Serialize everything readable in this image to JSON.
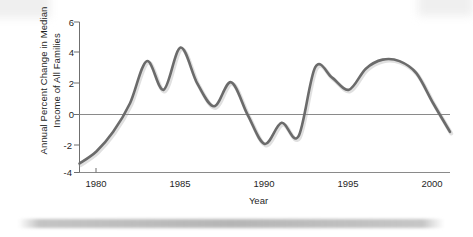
{
  "chart_data": {
    "type": "line",
    "title": "",
    "xlabel": "Year",
    "ylabel": "Annual Percent Change in Median\nIncome of All Families",
    "ylabel_line1": "Annual Percent Change in Median",
    "ylabel_line2": "Income of All Families",
    "xlim": [
      1979,
      2001
    ],
    "ylim": [
      -4,
      6
    ],
    "yticks": [
      6,
      4,
      2,
      0,
      -2,
      -4
    ],
    "ytick_labels": [
      "6",
      "4",
      "2",
      "0",
      "-2",
      "-4"
    ],
    "xticks": [
      1980,
      1985,
      1990,
      1995,
      2000
    ],
    "xtick_labels": [
      "1980",
      "1985",
      "1990",
      "1995",
      "2000"
    ],
    "grid": false,
    "legend": "none",
    "zero_line": 0,
    "line_color": "#6b6b6b",
    "axis_color": "#7a7a7a",
    "series": [
      {
        "name": "Annual percent change in median income of all families",
        "x": [
          1979,
          1980,
          1981,
          1982,
          1983,
          1984,
          1985,
          1986,
          1987,
          1988,
          1989,
          1990,
          1991,
          1992,
          1993,
          1994,
          1995,
          1996,
          1997,
          1998,
          1999,
          2000,
          2001
        ],
        "values": [
          -3.4,
          -2.6,
          -1.3,
          0.6,
          3.4,
          1.5,
          4.3,
          1.9,
          0.4,
          2.0,
          -0.2,
          -2.1,
          -0.7,
          -1.6,
          3.0,
          2.3,
          1.5,
          2.9,
          3.5,
          3.4,
          2.6,
          0.6,
          -1.3
        ]
      }
    ],
    "annotations": []
  },
  "figure": {
    "axes": {
      "y_axis_label": "Annual Percent Change in Median Income of All Families",
      "x_axis_label": "Year"
    }
  }
}
